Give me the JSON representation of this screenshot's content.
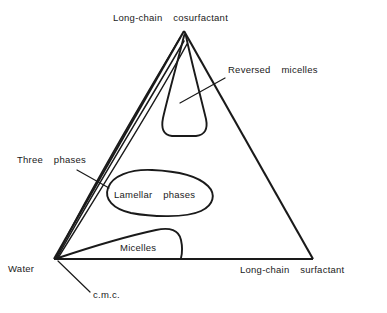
{
  "figure": {
    "kind": "ternary-phase-diagram",
    "background_color": "#ffffff",
    "line_color": "#1a1a1a",
    "text_color": "#1a1a1a"
  },
  "vertices": {
    "top": {
      "label": "Long-chain  cosurfactant",
      "x": 184,
      "y": 31
    },
    "bottom_left": {
      "label": "Water",
      "x": 54,
      "y": 259
    },
    "bottom_right": {
      "label": "Long-chain  surfactant",
      "x": 313,
      "y": 259
    }
  },
  "labels": {
    "top_apex": "Long-chain  cosurfactant",
    "bottom_left_vertex": "Water",
    "bottom_right_vertex": "Long-chain  surfactant",
    "reversed_micelles": "Reversed  micelles",
    "three_phases": "Three  phases",
    "lamellar_phases": "Lamellar  phases",
    "micelles": "Micelles",
    "cmc": "c.m.c."
  },
  "regions": [
    {
      "name": "reversed-micelles",
      "label": "Reversed  micelles",
      "description": "Tapered cone-shaped region descending from the cosurfactant apex with a rounded flat base",
      "anchor": {
        "x": 186,
        "y": 98
      }
    },
    {
      "name": "three-phases",
      "label": "Three  phases",
      "description": "Narrow sliver bounded by near-parallel lines converging from the water corner to the cosurfactant apex",
      "anchor": {
        "x": 105,
        "y": 185
      }
    },
    {
      "name": "lamellar-phases",
      "label": "Lamellar  phases",
      "description": "Closed lobe in the middle of the triangle",
      "anchor": {
        "x": 158,
        "y": 193
      }
    },
    {
      "name": "micelles",
      "label": "Micelles",
      "description": "Lens-shaped region along the water to long-chain surfactant base edge",
      "anchor": {
        "x": 140,
        "y": 247
      }
    },
    {
      "name": "cmc",
      "label": "c.m.c.",
      "description": "Critical micelle concentration marked near the water corner of the base edge",
      "anchor": {
        "x": 70,
        "y": 262
      }
    }
  ],
  "label_positions": {
    "top_apex": {
      "x": 113,
      "y": 21
    },
    "reversed_micelles": {
      "x": 228,
      "y": 73
    },
    "three_phases": {
      "x": 17,
      "y": 163
    },
    "lamellar_phases": {
      "x": 114,
      "y": 198
    },
    "micelles": {
      "x": 120,
      "y": 251
    },
    "water": {
      "x": 8,
      "y": 272
    },
    "cmc": {
      "x": 93,
      "y": 298
    },
    "bottom_right_vertex": {
      "x": 240,
      "y": 273
    }
  }
}
